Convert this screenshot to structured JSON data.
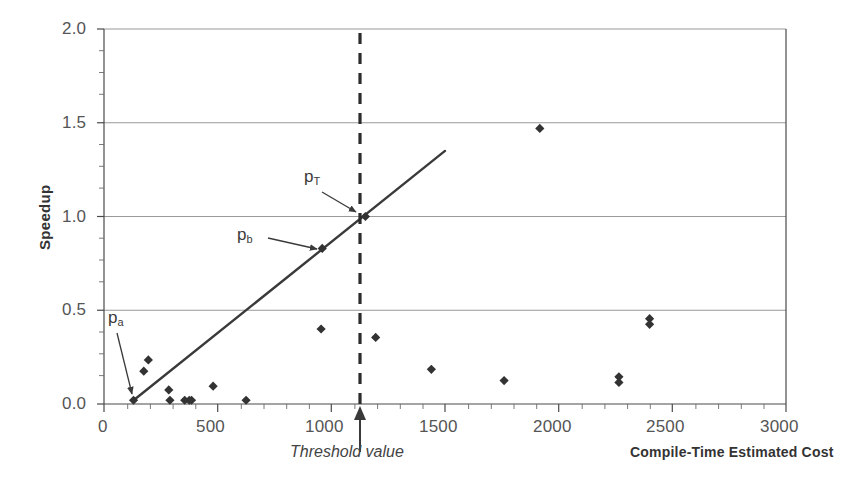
{
  "chart_data": {
    "type": "scatter",
    "title": "",
    "xlabel": "Compile-Time Estimated Cost",
    "ylabel": "Speedup",
    "xlim": [
      0,
      3000
    ],
    "ylim": [
      0.0,
      2.0
    ],
    "xticks": [
      0,
      500,
      1000,
      1500,
      2000,
      2500,
      3000
    ],
    "xtick_labels": [
      "0",
      "500",
      "1000",
      "1500",
      "2000",
      "2500",
      "3000"
    ],
    "yticks": [
      0.0,
      0.5,
      1.0,
      1.5,
      2.0
    ],
    "ytick_labels": [
      "0.0",
      "0.5",
      "1.0",
      "1.5",
      "2.0"
    ],
    "grid": "horizontal",
    "minor_ticks": true,
    "legend": "none",
    "marker": "diamond",
    "marker_color": "#333333",
    "points": [
      {
        "x": 130,
        "y": 0.02
      },
      {
        "x": 175,
        "y": 0.175
      },
      {
        "x": 195,
        "y": 0.235
      },
      {
        "x": 285,
        "y": 0.075
      },
      {
        "x": 290,
        "y": 0.02
      },
      {
        "x": 355,
        "y": 0.02
      },
      {
        "x": 375,
        "y": 0.02
      },
      {
        "x": 385,
        "y": 0.02
      },
      {
        "x": 480,
        "y": 0.095
      },
      {
        "x": 625,
        "y": 0.02
      },
      {
        "x": 955,
        "y": 0.4
      },
      {
        "x": 960,
        "y": 0.83
      },
      {
        "x": 1150,
        "y": 1.0
      },
      {
        "x": 1195,
        "y": 0.355
      },
      {
        "x": 1440,
        "y": 0.185
      },
      {
        "x": 1760,
        "y": 0.125
      },
      {
        "x": 1917,
        "y": 1.47
      },
      {
        "x": 2265,
        "y": 0.145
      },
      {
        "x": 2265,
        "y": 0.115
      },
      {
        "x": 2400,
        "y": 0.455
      },
      {
        "x": 2400,
        "y": 0.425
      }
    ],
    "trend_line": {
      "x0": 130,
      "y0": 0.02,
      "x1": 1500,
      "y1": 1.35,
      "style": "solid",
      "color": "#3a3a3a"
    },
    "threshold_line": {
      "x": 1125,
      "style": "dashed",
      "color": "#2b2b2b",
      "label": "Threshold value"
    },
    "annotations": [
      {
        "id": "p_a",
        "text": "p",
        "sub": "a",
        "target_x": 130,
        "target_y": 0.02
      },
      {
        "id": "p_b",
        "text": "p",
        "sub": "b",
        "target_x": 960,
        "target_y": 0.83
      },
      {
        "id": "p_T",
        "text": "p",
        "sub": "T",
        "target_x": 1150,
        "target_y": 1.0
      }
    ]
  }
}
